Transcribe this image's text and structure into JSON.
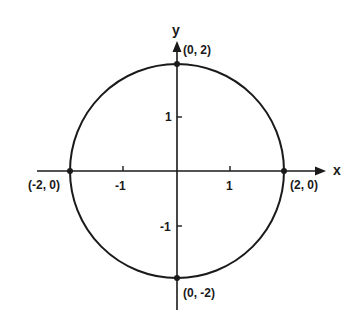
{
  "figure": {
    "type": "unit-circle-graph",
    "axes": {
      "x_label": "x",
      "y_label": "y",
      "x_ticks": [
        {
          "value": -1,
          "label": "-1"
        },
        {
          "value": 1,
          "label": "1"
        }
      ],
      "y_ticks": [
        {
          "value": 1,
          "label": "1"
        },
        {
          "value": -1,
          "label": "-1"
        }
      ]
    },
    "circle": {
      "center": [
        0,
        0
      ],
      "radius": 2
    },
    "points": [
      {
        "x": 0,
        "y": 2,
        "label": "(0, 2)"
      },
      {
        "x": -2,
        "y": 0,
        "label": "(-2, 0)"
      },
      {
        "x": 2,
        "y": 0,
        "label": "(2, 0)"
      },
      {
        "x": 0,
        "y": -2,
        "label": "(0, -2)"
      }
    ],
    "colors": {
      "stroke": "#1a1a1a",
      "background": "#ffffff"
    }
  }
}
